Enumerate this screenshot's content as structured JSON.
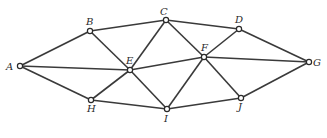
{
  "diagram": {
    "type": "graph",
    "nodes": [
      {
        "id": "A",
        "label": "A",
        "x": 20,
        "y": 66,
        "lx": 6,
        "ly": 70
      },
      {
        "id": "B",
        "label": "B",
        "x": 90,
        "y": 31,
        "lx": 86,
        "ly": 25
      },
      {
        "id": "C",
        "label": "C",
        "x": 166,
        "y": 20,
        "lx": 160,
        "ly": 15
      },
      {
        "id": "D",
        "label": "D",
        "x": 239,
        "y": 29,
        "lx": 235,
        "ly": 23
      },
      {
        "id": "E",
        "label": "E",
        "x": 130,
        "y": 70,
        "lx": 126,
        "ly": 64
      },
      {
        "id": "F",
        "label": "F",
        "x": 204,
        "y": 57,
        "lx": 201,
        "ly": 51
      },
      {
        "id": "G",
        "label": "G",
        "x": 309,
        "y": 62,
        "lx": 313,
        "ly": 66
      },
      {
        "id": "H",
        "label": "H",
        "x": 91,
        "y": 100,
        "lx": 87,
        "ly": 112
      },
      {
        "id": "I",
        "label": "I",
        "x": 167,
        "y": 109,
        "lx": 164,
        "ly": 122
      },
      {
        "id": "J",
        "label": "J",
        "x": 241,
        "y": 98,
        "lx": 238,
        "ly": 110
      }
    ],
    "edges": [
      [
        "A",
        "B"
      ],
      [
        "A",
        "E"
      ],
      [
        "A",
        "H"
      ],
      [
        "B",
        "C"
      ],
      [
        "B",
        "E"
      ],
      [
        "C",
        "D"
      ],
      [
        "C",
        "E"
      ],
      [
        "C",
        "F"
      ],
      [
        "D",
        "F"
      ],
      [
        "D",
        "G"
      ],
      [
        "E",
        "F"
      ],
      [
        "E",
        "H"
      ],
      [
        "E",
        "I"
      ],
      [
        "F",
        "G"
      ],
      [
        "F",
        "I"
      ],
      [
        "F",
        "J"
      ],
      [
        "H",
        "I"
      ],
      [
        "I",
        "J"
      ],
      [
        "J",
        "G"
      ]
    ]
  }
}
